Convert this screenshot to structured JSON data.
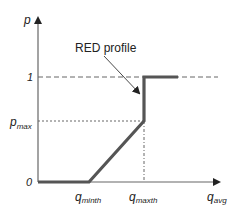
{
  "diagram": {
    "title": "RED profile",
    "annotation": "RED profile",
    "y_axis": {
      "label": "p",
      "ticks": [
        {
          "label": "0",
          "value": 0
        },
        {
          "label": "p",
          "sub": "max",
          "value": "pmax"
        },
        {
          "label": "1",
          "value": 1
        }
      ]
    },
    "x_axis": {
      "label": "q",
      "sub": "avg",
      "ticks": [
        {
          "label": "q",
          "sub": "minth"
        },
        {
          "label": "q",
          "sub": "maxth"
        }
      ]
    },
    "curve": [
      {
        "x": "0",
        "y": 0
      },
      {
        "x": "q_minth",
        "y": 0
      },
      {
        "x": "q_maxth",
        "y": "p_max"
      },
      {
        "x": "q_maxth",
        "y": 1
      },
      {
        "x": "beyond",
        "y": 1
      }
    ],
    "colors": {
      "curve": "#555555",
      "axes": "#555555",
      "guides": "#555555"
    }
  }
}
